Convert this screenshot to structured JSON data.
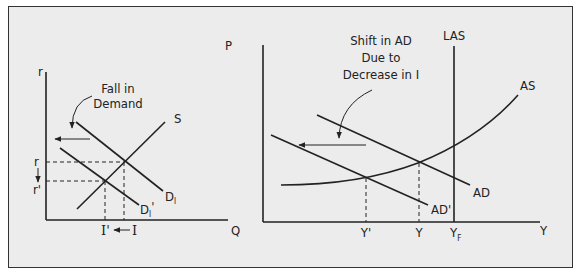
{
  "left_panel": {
    "y_axis_label": "r",
    "x_axis_label": "Q",
    "annotation_line1": "Fall in",
    "annotation_line2": "Demand",
    "supply_label": "S",
    "demand_label": "D",
    "demand_label_sub": "I",
    "demand_new_label": "D",
    "demand_new_sub": "I",
    "demand_new_prime": "'",
    "rate_label": "r",
    "rate_new_label": "r'",
    "invest_label": "I",
    "invest_new_label": "I'"
  },
  "right_panel": {
    "y_axis_label": "P",
    "x_axis_label": "Y",
    "annotation_line1": "Shift in AD",
    "annotation_line2": "Due to",
    "annotation_line3": "Decrease in I",
    "las_label": "LAS",
    "as_label": "AS",
    "ad_label": "AD",
    "ad_new_label": "AD'",
    "output_label": "Y",
    "output_new_label": "Y'",
    "full_output_label": "Y",
    "full_output_sub": "F"
  },
  "colors": {
    "background": "#ececec",
    "line": "#222222",
    "border": "#333333"
  }
}
